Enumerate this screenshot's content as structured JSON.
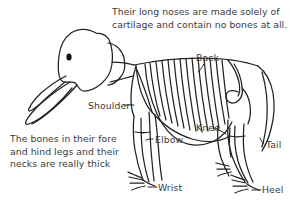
{
  "figure": {
    "style": "hand-drawn line illustration",
    "background_color": "#ffffff",
    "ink_color": "#222222",
    "text_color": "#3a3a3a"
  },
  "notes": {
    "nose": "Their long noses are made solely of\ncartilage and contain no bones at all.",
    "bones": "The bones in their fore\nand hind legs and their\nnecks are really thick"
  },
  "labels": {
    "back": "Back",
    "shoulder": "Shoulder",
    "elbow": "Elbow",
    "knee": "Knee",
    "tail": "Tail",
    "wrist": "Wrist",
    "heel": "Heel"
  }
}
